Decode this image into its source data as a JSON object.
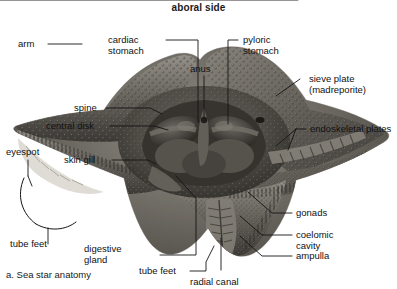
{
  "figure": {
    "title": "aboral side",
    "caption": "a. Sea star anatomy",
    "style": "grayscale photograph with leader lines",
    "colors": {
      "background": "#ffffff",
      "text": "#111111",
      "leader_line": "#1a1a1a",
      "specimen_dark": "#4a4742",
      "specimen_mid": "#7d7a73",
      "specimen_light": "#b5b1a8"
    }
  },
  "labels": [
    {
      "id": "arm",
      "text": "arm"
    },
    {
      "id": "cardiac-stomach",
      "text": "cardiac\nstomach"
    },
    {
      "id": "anus",
      "text": "anus"
    },
    {
      "id": "pyloric-stomach",
      "text": "pyloric\nstomach"
    },
    {
      "id": "sieve-plate",
      "text": "sieve plate\n(madreporite)"
    },
    {
      "id": "spine",
      "text": "spine"
    },
    {
      "id": "central-disk",
      "text": "central disk"
    },
    {
      "id": "endoskeletal-plates",
      "text": "endoskeletal plates"
    },
    {
      "id": "eyespot",
      "text": "eyespot"
    },
    {
      "id": "skin-gill",
      "text": "skin gill"
    },
    {
      "id": "tube-feet-left",
      "text": "tube feet"
    },
    {
      "id": "digestive-gland",
      "text": "digestive\ngland"
    },
    {
      "id": "tube-feet-bottom",
      "text": "tube feet"
    },
    {
      "id": "radial-canal",
      "text": "radial canal"
    },
    {
      "id": "gonads",
      "text": "gonads"
    },
    {
      "id": "coelomic-cavity",
      "text": "coelomic\ncavity"
    },
    {
      "id": "ampulla",
      "text": "ampulla"
    }
  ]
}
